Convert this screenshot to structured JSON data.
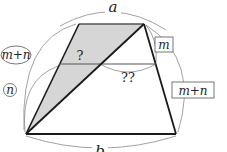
{
  "diagram": {
    "type": "trapezoid-geometry",
    "labels": {
      "top_base": "a",
      "bottom_base": "b",
      "left_total": "m+n",
      "left_lower": "n",
      "right_upper": "m",
      "right_total": "m+n",
      "unknown_left_segment": "?",
      "unknown_right_segment": "??"
    },
    "colors": {
      "stroke": "#1a1a1a",
      "shade": "#d6d6d6",
      "arc": "#8a8a8a"
    }
  }
}
